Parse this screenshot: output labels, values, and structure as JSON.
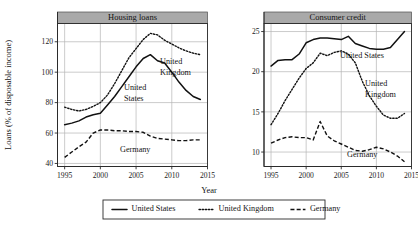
{
  "figure": {
    "ylabel": "Loans (% of disposable income)",
    "xlabel": "Year"
  },
  "legend": {
    "items": [
      {
        "label": "United States",
        "style": "solid"
      },
      {
        "label": "United Kingdom",
        "style": "dotted"
      },
      {
        "label": "Germany",
        "style": "dashed"
      }
    ]
  },
  "annotations": {
    "left": [
      {
        "label": "United States",
        "line1": "United",
        "line2": "States"
      },
      {
        "label": "United Kingdom",
        "line1": "United",
        "line2": "Kingdom"
      },
      {
        "label": "Germany",
        "line1": "Germany",
        "line2": ""
      }
    ],
    "right": [
      {
        "label": "United States",
        "line1": "United States",
        "line2": ""
      },
      {
        "label": "United Kingdom",
        "line1": "United",
        "line2": "Kingdom"
      },
      {
        "label": "Germany",
        "line1": "Germany",
        "line2": ""
      }
    ]
  },
  "chart_data": [
    {
      "type": "line",
      "title": "Housing loans",
      "xlabel": "Year",
      "ylabel": "Loans (% of disposable income)",
      "xlim": [
        1994,
        2015
      ],
      "ylim": [
        38,
        132
      ],
      "xticks": [
        1995,
        2000,
        2005,
        2010,
        2015
      ],
      "yticks": [
        40,
        60,
        80,
        100,
        120
      ],
      "grid": true,
      "legend_position": "bottom-center-shared",
      "x": [
        1995,
        1996,
        1997,
        1998,
        1999,
        2000,
        2001,
        2002,
        2003,
        2004,
        2005,
        2006,
        2007,
        2008,
        2009,
        2010,
        2011,
        2012,
        2013,
        2014
      ],
      "series": [
        {
          "name": "United States",
          "style": "solid",
          "values": [
            65.5,
            66.5,
            68.0,
            70.5,
            72.0,
            73.0,
            78.5,
            84.0,
            90.5,
            97.0,
            103.5,
            109.0,
            111.5,
            107.5,
            106.0,
            100.0,
            93.5,
            88.0,
            84.0,
            82.0
          ]
        },
        {
          "name": "United Kingdom",
          "style": "dotted",
          "values": [
            77.0,
            75.5,
            74.5,
            75.5,
            77.5,
            80.0,
            85.0,
            92.5,
            101.0,
            109.5,
            115.5,
            121.5,
            125.5,
            124.5,
            121.0,
            118.5,
            116.0,
            114.0,
            112.5,
            111.5
          ]
        },
        {
          "name": "Germany",
          "style": "dashed",
          "values": [
            44.0,
            47.5,
            51.0,
            54.0,
            60.0,
            62.0,
            62.0,
            61.5,
            61.5,
            61.0,
            61.0,
            60.5,
            58.0,
            56.5,
            56.0,
            55.5,
            55.0,
            55.0,
            55.5,
            55.5
          ]
        }
      ]
    },
    {
      "type": "line",
      "title": "Consumer credit",
      "xlabel": "Year",
      "ylabel": "Loans (% of disposable income)",
      "xlim": [
        1994,
        2015
      ],
      "ylim": [
        8.2,
        26.0
      ],
      "xticks": [
        1995,
        2000,
        2005,
        2010,
        2015
      ],
      "yticks": [
        10,
        15,
        20,
        25
      ],
      "grid": true,
      "legend_position": "bottom-center-shared",
      "x": [
        1995,
        1996,
        1997,
        1998,
        1999,
        2000,
        2001,
        2002,
        2003,
        2004,
        2005,
        2006,
        2007,
        2008,
        2009,
        2010,
        2011,
        2012,
        2013,
        2014
      ],
      "series": [
        {
          "name": "United States",
          "style": "solid",
          "values": [
            20.7,
            21.4,
            21.5,
            21.5,
            22.2,
            23.6,
            24.0,
            24.2,
            24.2,
            24.1,
            24.0,
            24.4,
            23.5,
            23.2,
            22.9,
            22.8,
            22.8,
            23.0,
            24.0,
            25.0
          ]
        },
        {
          "name": "United Kingdom",
          "style": "dotted",
          "values": [
            13.4,
            14.8,
            16.4,
            17.8,
            19.2,
            20.4,
            21.1,
            22.3,
            22.0,
            22.4,
            22.6,
            22.2,
            21.1,
            18.8,
            17.0,
            15.7,
            14.6,
            14.2,
            14.2,
            14.8
          ]
        },
        {
          "name": "Germany",
          "style": "dashed",
          "values": [
            11.1,
            11.5,
            11.8,
            11.9,
            11.8,
            11.8,
            11.5,
            13.8,
            12.0,
            11.4,
            11.0,
            10.6,
            10.2,
            10.1,
            10.3,
            10.6,
            10.4,
            10.0,
            9.5,
            8.8
          ]
        }
      ]
    }
  ]
}
